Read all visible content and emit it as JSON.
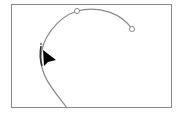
{
  "canvas": {
    "frame": {
      "x": 11,
      "y": 4,
      "width": 161,
      "height": 104,
      "border_color": "#8a8a8a"
    },
    "path": {
      "stroke_color": "#8a8a8a",
      "stroke_width": 1.2,
      "d": "M 67 108 C 55 92, 40 76, 41 58 C 41 40, 56 18, 77 11 C 100 5, 122 14, 132 29",
      "highlight_d": "M 41 46 C 40 52, 40 60, 42 66",
      "highlight_color": "#333333"
    },
    "anchors": [
      {
        "name": "anchor-top",
        "x": 77,
        "y": 11,
        "r": 2.5
      },
      {
        "name": "anchor-end",
        "x": 132,
        "y": 29,
        "r": 2.5
      }
    ],
    "selected_anchor": {
      "x": 41,
      "y": 44,
      "size": 2
    },
    "cursor": {
      "type": "arrow",
      "color": "#000000",
      "points": "43,50 56,60 48,62 44,66"
    }
  }
}
